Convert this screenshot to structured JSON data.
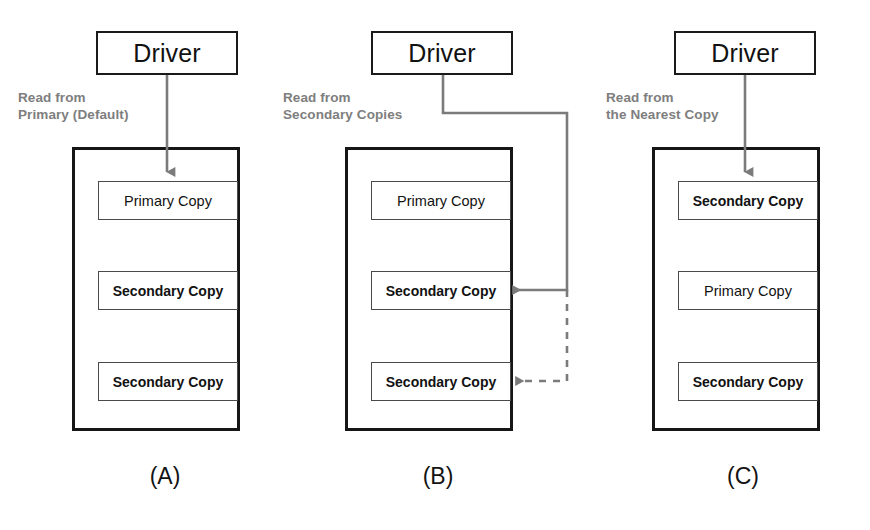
{
  "figure": {
    "accent_line_color": "#7b7b7b",
    "box_border_color": "#161616",
    "note_text_color": "#7e7e7e"
  },
  "panels": [
    {
      "id": "A",
      "caption": "(A)",
      "driver_label": "Driver",
      "note": "Read from\nPrimary (Default)",
      "nodes": [
        {
          "label": "Primary Copy",
          "emphasis": "normal"
        },
        {
          "label": "Secondary Copy",
          "emphasis": "bold"
        },
        {
          "label": "Secondary Copy",
          "emphasis": "bold"
        }
      ],
      "arrows": [
        {
          "style": "solid",
          "target_index": 0,
          "direction": "down"
        }
      ]
    },
    {
      "id": "B",
      "caption": "(B)",
      "driver_label": "Driver",
      "note": "Read from\nSecondary Copies",
      "nodes": [
        {
          "label": "Primary Copy",
          "emphasis": "normal"
        },
        {
          "label": "Secondary Copy",
          "emphasis": "bold"
        },
        {
          "label": "Secondary Copy",
          "emphasis": "bold"
        }
      ],
      "arrows": [
        {
          "style": "solid",
          "target_index": 1,
          "direction": "left"
        },
        {
          "style": "dashed",
          "target_index": 2,
          "direction": "left"
        }
      ]
    },
    {
      "id": "C",
      "caption": "(C)",
      "driver_label": "Driver",
      "note": "Read from\nthe Nearest Copy",
      "nodes": [
        {
          "label": "Secondary Copy",
          "emphasis": "bold"
        },
        {
          "label": "Primary Copy",
          "emphasis": "normal"
        },
        {
          "label": "Secondary Copy",
          "emphasis": "bold"
        }
      ],
      "arrows": [
        {
          "style": "solid",
          "target_index": 0,
          "direction": "down"
        }
      ]
    }
  ]
}
